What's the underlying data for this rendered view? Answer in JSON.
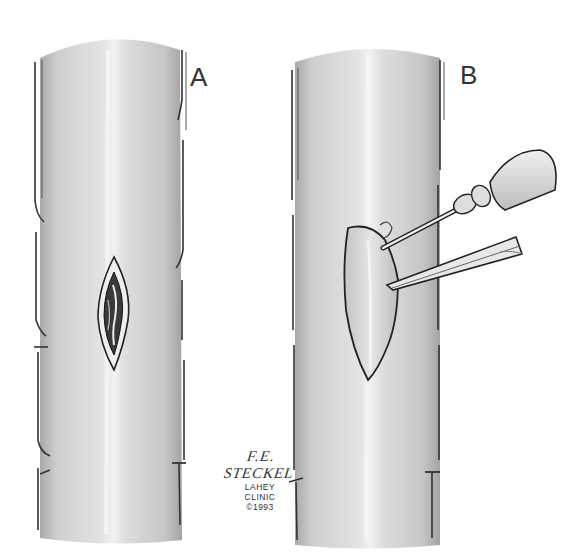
{
  "figure": {
    "panels": [
      {
        "label": "A",
        "description": "Blood vessel with longitudinal lesion"
      },
      {
        "label": "B",
        "description": "Blood vessel with flap lifted by instruments (needle/syringe and forceps)"
      }
    ],
    "credit": {
      "artist": "F.E. STECKEL",
      "institution_line1": "LAHEY",
      "institution_line2": "CLINIC",
      "copyright": "©1993"
    },
    "colors": {
      "background": "#ffffff",
      "vessel_fill": "#d9d9d9",
      "vessel_shade": "#bdbdbd",
      "line": "#2b2b2b",
      "highlight": "#f4f4f4"
    }
  }
}
